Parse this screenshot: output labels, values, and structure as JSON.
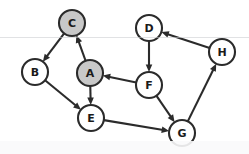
{
  "graph": {
    "title": "Directed Graph",
    "type": "directed-graph",
    "background_color": "#ffffff",
    "stroke_color": "#2b2b2b",
    "node_radius": 13,
    "highlight_fill": "#c8c8c8",
    "default_fill": "#ffffff",
    "nodes": [
      {
        "id": "A",
        "label": "A",
        "x": 90,
        "y": 73,
        "fill": "#c8c8c8",
        "highlighted": true
      },
      {
        "id": "B",
        "label": "B",
        "x": 35,
        "y": 72,
        "fill": "#ffffff",
        "highlighted": false
      },
      {
        "id": "C",
        "label": "C",
        "x": 72,
        "y": 23,
        "fill": "#c8c8c8",
        "highlighted": true
      },
      {
        "id": "D",
        "label": "D",
        "x": 149,
        "y": 28,
        "fill": "#ffffff",
        "highlighted": false
      },
      {
        "id": "E",
        "label": "E",
        "x": 91,
        "y": 118,
        "fill": "#ffffff",
        "highlighted": false
      },
      {
        "id": "F",
        "label": "F",
        "x": 149,
        "y": 85,
        "fill": "#ffffff",
        "highlighted": false
      },
      {
        "id": "G",
        "label": "G",
        "x": 182,
        "y": 133,
        "fill": "#ffffff",
        "highlighted": false
      },
      {
        "id": "H",
        "label": "H",
        "x": 222,
        "y": 52,
        "fill": "#ffffff",
        "highlighted": false
      }
    ],
    "edges": [
      {
        "from": "A",
        "to": "C",
        "directed": true
      },
      {
        "from": "C",
        "to": "B",
        "directed": true
      },
      {
        "from": "B",
        "to": "E",
        "directed": true
      },
      {
        "from": "A",
        "to": "E",
        "directed": true
      },
      {
        "from": "F",
        "to": "A",
        "directed": true
      },
      {
        "from": "D",
        "to": "F",
        "directed": true
      },
      {
        "from": "F",
        "to": "G",
        "directed": true
      },
      {
        "from": "E",
        "to": "G",
        "directed": true
      },
      {
        "from": "G",
        "to": "H",
        "directed": true
      },
      {
        "from": "H",
        "to": "D",
        "directed": true
      }
    ]
  }
}
